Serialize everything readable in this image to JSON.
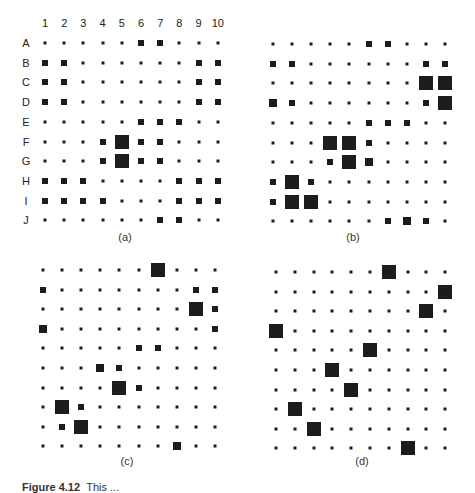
{
  "figure": {
    "caption_fragment_bold": "Figure 4.12",
    "caption_fragment": "This ..."
  },
  "chart_data": [
    {
      "type": "heatmap",
      "title": "(a)",
      "row_labels": [
        "A",
        "B",
        "C",
        "D",
        "E",
        "F",
        "G",
        "H",
        "I",
        "J"
      ],
      "col_labels": [
        "1",
        "2",
        "3",
        "4",
        "5",
        "6",
        "7",
        "8",
        "9",
        "10"
      ],
      "size_scale": "0=dot,1=small,2=medium,3=large",
      "values": [
        [
          0,
          0,
          0,
          0,
          0,
          1,
          1,
          0,
          0,
          0
        ],
        [
          1,
          1,
          0,
          0,
          0,
          0,
          0,
          0,
          1,
          1
        ],
        [
          1,
          1,
          0,
          0,
          0,
          0,
          0,
          0,
          1,
          1
        ],
        [
          1,
          1,
          0,
          0,
          0,
          0,
          0,
          0,
          1,
          1
        ],
        [
          0,
          0,
          0,
          0,
          0,
          1,
          1,
          1,
          0,
          0
        ],
        [
          0,
          0,
          0,
          1,
          3,
          1,
          1,
          0,
          0,
          0
        ],
        [
          0,
          0,
          0,
          1,
          3,
          1,
          1,
          0,
          0,
          0
        ],
        [
          1,
          1,
          1,
          0,
          0,
          0,
          0,
          1,
          1,
          1
        ],
        [
          1,
          1,
          1,
          1,
          0,
          0,
          0,
          1,
          1,
          1
        ],
        [
          0,
          0,
          0,
          0,
          0,
          0,
          1,
          1,
          0,
          0
        ]
      ]
    },
    {
      "type": "heatmap",
      "title": "(b)",
      "size_scale": "0=dot,1=small,2=medium,3=large",
      "values": [
        [
          0,
          0,
          0,
          0,
          0,
          1,
          1,
          0,
          0,
          0
        ],
        [
          1,
          1,
          0,
          0,
          0,
          0,
          0,
          0,
          1,
          1
        ],
        [
          0,
          0,
          0,
          0,
          0,
          0,
          0,
          0,
          3,
          3
        ],
        [
          2,
          1,
          0,
          0,
          0,
          0,
          0,
          0,
          1,
          3
        ],
        [
          0,
          0,
          0,
          0,
          0,
          1,
          1,
          1,
          0,
          0
        ],
        [
          0,
          0,
          0,
          3,
          3,
          1,
          0,
          0,
          0,
          0
        ],
        [
          0,
          0,
          0,
          1,
          3,
          2,
          0,
          0,
          0,
          0
        ],
        [
          1,
          3,
          1,
          0,
          0,
          0,
          0,
          0,
          0,
          0
        ],
        [
          1,
          3,
          3,
          0,
          0,
          0,
          0,
          0,
          0,
          0
        ],
        [
          0,
          0,
          0,
          0,
          0,
          0,
          1,
          2,
          1,
          0
        ]
      ]
    },
    {
      "type": "heatmap",
      "title": "(c)",
      "size_scale": "0=dot,1=small,2=medium,3=large",
      "values": [
        [
          0,
          0,
          0,
          0,
          0,
          0,
          3,
          0,
          0,
          0
        ],
        [
          1,
          0,
          0,
          0,
          0,
          0,
          0,
          0,
          1,
          1
        ],
        [
          0,
          0,
          0,
          0,
          0,
          0,
          0,
          0,
          3,
          1
        ],
        [
          2,
          0,
          0,
          0,
          0,
          0,
          0,
          0,
          0,
          1
        ],
        [
          0,
          0,
          0,
          0,
          0,
          1,
          1,
          0,
          0,
          0
        ],
        [
          0,
          0,
          0,
          2,
          1,
          0,
          0,
          0,
          0,
          0
        ],
        [
          0,
          0,
          0,
          0,
          3,
          1,
          0,
          0,
          0,
          0
        ],
        [
          0,
          3,
          1,
          0,
          0,
          0,
          0,
          0,
          0,
          0
        ],
        [
          0,
          1,
          3,
          0,
          0,
          0,
          0,
          0,
          0,
          0
        ],
        [
          0,
          0,
          0,
          0,
          0,
          0,
          0,
          2,
          0,
          0
        ]
      ]
    },
    {
      "type": "heatmap",
      "title": "(d)",
      "size_scale": "0=dot,1=small,2=medium,3=large",
      "values": [
        [
          0,
          0,
          0,
          0,
          0,
          0,
          3,
          0,
          0,
          0
        ],
        [
          0,
          0,
          0,
          0,
          0,
          0,
          0,
          0,
          0,
          3
        ],
        [
          0,
          0,
          0,
          0,
          0,
          0,
          0,
          0,
          3,
          0
        ],
        [
          3,
          0,
          0,
          0,
          0,
          0,
          0,
          0,
          0,
          0
        ],
        [
          0,
          0,
          0,
          0,
          0,
          3,
          0,
          0,
          0,
          0
        ],
        [
          0,
          0,
          0,
          3,
          0,
          0,
          0,
          0,
          0,
          0
        ],
        [
          0,
          0,
          0,
          0,
          3,
          0,
          0,
          0,
          0,
          0
        ],
        [
          0,
          3,
          0,
          0,
          0,
          0,
          0,
          0,
          0,
          0
        ],
        [
          0,
          0,
          3,
          0,
          0,
          0,
          0,
          0,
          0,
          0
        ],
        [
          0,
          0,
          0,
          0,
          0,
          0,
          0,
          3,
          0,
          0
        ]
      ]
    }
  ]
}
